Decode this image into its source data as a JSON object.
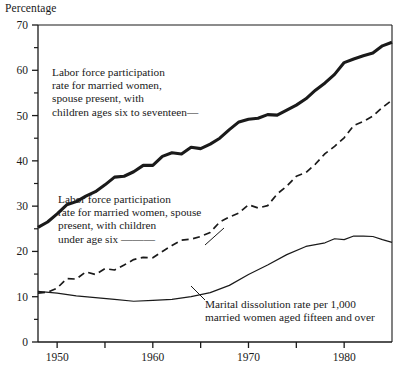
{
  "axis_title": "Percentage",
  "annotations": {
    "top": "Labor force participation\nrate for married women,\nspouse present, with\nchildren ages six to seventeen—",
    "middle": "Labor force participation\nrate for married women, spouse\npresent, with children\nunder age six ———",
    "bottom": "Marital dissolution rate per 1,000\nmarried women aged fifteen and over"
  },
  "colors": {
    "ink": "#1a1a1a",
    "background": "#ffffff"
  },
  "chart_data": {
    "type": "line",
    "title": "",
    "xlabel": "",
    "ylabel": "Percentage",
    "xlim": [
      1948,
      1985
    ],
    "ylim": [
      0,
      70
    ],
    "yticks": [
      0,
      10,
      20,
      30,
      40,
      50,
      60,
      70
    ],
    "yminor_ticks": [
      5,
      15,
      25,
      35,
      45,
      55,
      65
    ],
    "xticks": [
      1950,
      1955,
      1960,
      1965,
      1970,
      1975,
      1980,
      1985
    ],
    "xticklabels": [
      "1950",
      "",
      "1960",
      "",
      "1970",
      "",
      "1980",
      ""
    ],
    "grid": false,
    "legend": "inline-annotations",
    "series": [
      {
        "name": "Labor force participation rate for married women, spouse present, with children ages six to seventeen",
        "style": "thick-solid",
        "x": [
          1948,
          1949,
          1950,
          1951,
          1952,
          1953,
          1954,
          1955,
          1956,
          1957,
          1958,
          1959,
          1960,
          1961,
          1962,
          1963,
          1964,
          1965,
          1966,
          1967,
          1968,
          1969,
          1970,
          1971,
          1972,
          1973,
          1974,
          1975,
          1976,
          1977,
          1978,
          1979,
          1980,
          1981,
          1982,
          1983,
          1984,
          1985
        ],
        "values": [
          25.3,
          26.5,
          28.3,
          30.3,
          31.0,
          32.2,
          33.2,
          34.7,
          36.4,
          36.6,
          37.6,
          39.0,
          39.0,
          41.0,
          41.8,
          41.5,
          43.0,
          42.7,
          43.7,
          45.0,
          46.9,
          48.6,
          49.2,
          49.4,
          50.2,
          50.1,
          51.2,
          52.3,
          53.7,
          55.6,
          57.2,
          59.1,
          61.7,
          62.5,
          63.2,
          63.8,
          65.4,
          66.2
        ]
      },
      {
        "name": "Labor force participation rate for married women, spouse present, with children under age six",
        "style": "dashed",
        "x": [
          1948,
          1949,
          1950,
          1951,
          1952,
          1953,
          1954,
          1955,
          1956,
          1957,
          1958,
          1959,
          1960,
          1961,
          1962,
          1963,
          1964,
          1965,
          1966,
          1967,
          1968,
          1969,
          1970,
          1971,
          1972,
          1973,
          1974,
          1975,
          1976,
          1977,
          1978,
          1979,
          1980,
          1981,
          1982,
          1983,
          1984,
          1985
        ],
        "values": [
          10.8,
          11.0,
          11.9,
          14.0,
          13.9,
          15.5,
          14.9,
          16.2,
          15.9,
          17.0,
          18.2,
          18.7,
          18.6,
          20.0,
          21.3,
          22.5,
          22.7,
          23.3,
          24.2,
          26.5,
          27.6,
          28.5,
          30.3,
          29.6,
          30.1,
          32.7,
          34.4,
          36.6,
          37.4,
          39.3,
          41.6,
          43.2,
          45.1,
          47.8,
          48.7,
          49.9,
          51.8,
          53.4
        ]
      },
      {
        "name": "Marital dissolution rate per 1,000 married women aged fifteen and over",
        "style": "thin-solid",
        "x": [
          1948,
          1950,
          1952,
          1954,
          1956,
          1958,
          1960,
          1962,
          1964,
          1966,
          1968,
          1970,
          1972,
          1974,
          1976,
          1978,
          1979,
          1980,
          1981,
          1982,
          1983,
          1984,
          1985
        ],
        "values": [
          11.2,
          10.8,
          10.2,
          9.8,
          9.4,
          9.0,
          9.2,
          9.4,
          10.0,
          10.9,
          12.5,
          14.9,
          17.0,
          19.3,
          21.1,
          21.9,
          22.8,
          22.6,
          23.4,
          23.4,
          23.3,
          22.6,
          22.0
        ]
      }
    ]
  }
}
